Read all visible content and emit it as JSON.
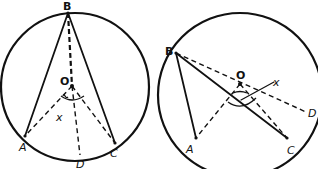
{
  "figures": [
    {
      "id": "left",
      "circle": {
        "cx": 75,
        "cy": 87,
        "r": 74
      },
      "points": {
        "B": {
          "x": 68,
          "y": 13,
          "label": "B",
          "lx": 63,
          "ly": 10
        },
        "O": {
          "x": 72,
          "y": 86,
          "label": "O",
          "lx": 61,
          "ly": 84
        },
        "A": {
          "x": 25,
          "y": 136,
          "label": "A",
          "lx": 18,
          "ly": 151
        },
        "C": {
          "x": 115,
          "y": 143,
          "label": "C",
          "lx": 110,
          "ly": 156
        },
        "D": {
          "x": 80,
          "y": 155,
          "label": "D",
          "lx": 76,
          "ly": 167
        },
        "X": {
          "label": "x",
          "lx": 56,
          "ly": 120
        }
      }
    },
    {
      "id": "right",
      "circle": {
        "cx": 240,
        "cy": 95,
        "r": 82
      },
      "points": {
        "B": {
          "x": 176,
          "y": 53,
          "label": "B",
          "lx": 166,
          "ly": 55
        },
        "O": {
          "x": 240,
          "y": 84,
          "label": "O",
          "lx": 236,
          "ly": 79
        },
        "A": {
          "x": 196,
          "y": 138,
          "label": "A",
          "lx": 186,
          "ly": 153
        },
        "C": {
          "x": 287,
          "y": 138,
          "label": "C",
          "lx": 287,
          "ly": 153
        },
        "D": {
          "x": 306,
          "y": 112,
          "label": "D",
          "lx": 309,
          "ly": 117
        },
        "X": {
          "label": "x",
          "lx": 273,
          "ly": 85
        }
      }
    }
  ],
  "labels": {
    "left_B": "B",
    "left_O": "O",
    "left_A": "A",
    "left_C": "C",
    "left_D": "D",
    "left_X": "x",
    "right_B": "B",
    "right_O": "O",
    "right_A": "A",
    "right_C": "C",
    "right_D": "D",
    "right_X": "x"
  }
}
